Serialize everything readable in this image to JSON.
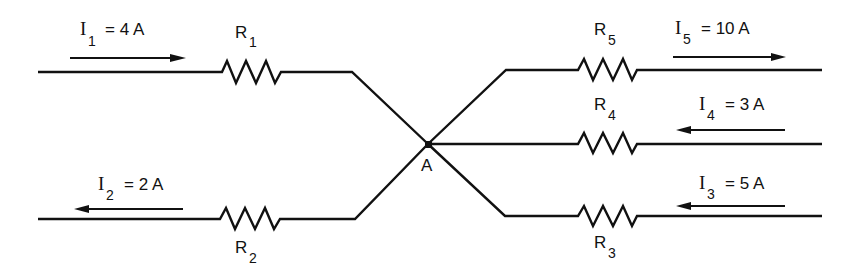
{
  "diagram": {
    "node": {
      "label": "A",
      "x": 428,
      "y": 144
    },
    "colors": {
      "stroke": "#111111",
      "background": "#ffffff"
    },
    "currents": [
      {
        "id": "I1",
        "symbol": "I",
        "sub": "1",
        "eq": "= 4 A",
        "value": 4,
        "unit": "A",
        "direction": "toward-node"
      },
      {
        "id": "I2",
        "symbol": "I",
        "sub": "2",
        "eq": "= 2 A",
        "value": 2,
        "unit": "A",
        "direction": "away-from-node"
      },
      {
        "id": "I3",
        "symbol": "I",
        "sub": "3",
        "eq": "= 5 A",
        "value": 5,
        "unit": "A",
        "direction": "toward-node"
      },
      {
        "id": "I4",
        "symbol": "I",
        "sub": "4",
        "eq": "= 3 A",
        "value": 3,
        "unit": "A",
        "direction": "toward-node"
      },
      {
        "id": "I5",
        "symbol": "I",
        "sub": "5",
        "eq": "= 10 A",
        "value": 10,
        "unit": "A",
        "direction": "away-from-node"
      }
    ],
    "resistors": [
      {
        "id": "R1",
        "symbol": "R",
        "sub": "1"
      },
      {
        "id": "R2",
        "symbol": "R",
        "sub": "2"
      },
      {
        "id": "R3",
        "symbol": "R",
        "sub": "3"
      },
      {
        "id": "R4",
        "symbol": "R",
        "sub": "4"
      },
      {
        "id": "R5",
        "symbol": "R",
        "sub": "5"
      }
    ]
  }
}
